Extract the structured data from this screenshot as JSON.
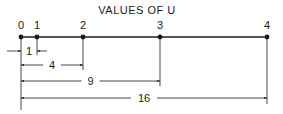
{
  "title": "VALUES OF U",
  "colors": {
    "ink": "#1a1a1a",
    "background": "#ffffff"
  },
  "points": [
    {
      "label": "0",
      "x": 21
    },
    {
      "label": "1",
      "x": 37
    },
    {
      "label": "2",
      "x": 83
    },
    {
      "label": "3",
      "x": 160
    },
    {
      "label": "4",
      "x": 267
    }
  ],
  "dimensions": [
    {
      "label": "1",
      "from": 21,
      "to": 37,
      "y": 51,
      "style": "outside"
    },
    {
      "label": "4",
      "from": 21,
      "to": 83,
      "y": 65,
      "style": "inside"
    },
    {
      "label": "9",
      "from": 21,
      "to": 160,
      "y": 81,
      "style": "inside"
    },
    {
      "label": "16",
      "from": 21,
      "to": 267,
      "y": 98,
      "style": "inside"
    }
  ]
}
